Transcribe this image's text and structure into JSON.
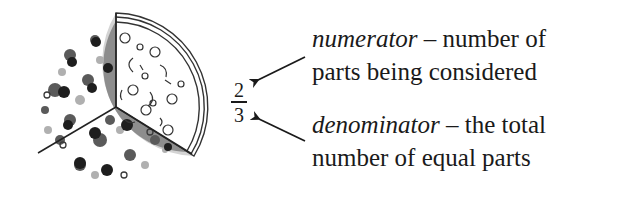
{
  "figure": {
    "pizza": {
      "total_slices": 3,
      "highlighted_slices": 2,
      "plain_slices": 1,
      "description": "pizza divided into 3 equal parts, 2 topped, 1 outlined"
    },
    "fraction": {
      "numerator": "2",
      "denominator": "3"
    },
    "annotations": {
      "numerator": {
        "term": "numerator",
        "dash": " – ",
        "line1_rest": "number of",
        "line2": "parts being considered"
      },
      "denominator": {
        "term": "denominator",
        "dash": " – ",
        "line1_rest": "the total",
        "line2": "number of equal parts"
      }
    },
    "colors": {
      "text": "#1a1a1a",
      "crust": "#cfcfcf",
      "topping_dark": "#2a2a2a",
      "cheese": "#9a9a9a",
      "outline": "#333333"
    }
  }
}
